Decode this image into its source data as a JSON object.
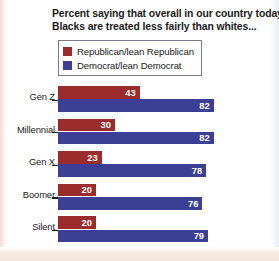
{
  "chart_data": {
    "type": "bar",
    "orientation": "horizontal",
    "title": "Percent saying that overall in our country today, Blacks are treated less fairly than whites...",
    "title_lines": [
      "Percent saying that overall in our country today,",
      "Blacks are treated less fairly than whites..."
    ],
    "xlabel": "",
    "ylabel": "",
    "xlim": [
      0,
      100
    ],
    "grid": false,
    "legend_position": "top-left",
    "categories": [
      "Gen Z",
      "Millennial",
      "Gen X",
      "Boomer",
      "Silent"
    ],
    "series": [
      {
        "name": "Republican/lean Republican",
        "color": "#9c2b2b",
        "values": [
          43,
          30,
          23,
          20,
          20
        ]
      },
      {
        "name": "Democrat/lean Democrat",
        "color": "#3c3f96",
        "values": [
          82,
          82,
          78,
          76,
          79
        ]
      }
    ]
  },
  "legend": {
    "items": [
      {
        "label": "Republican/lean Republican",
        "color": "#9c2b2b"
      },
      {
        "label": "Democrat/lean Democrat",
        "color": "#3c3f96"
      }
    ]
  },
  "rows": [
    {
      "category": "Gen Z",
      "rep": {
        "value": "43",
        "pct": 43
      },
      "dem": {
        "value": "82",
        "pct": 82
      }
    },
    {
      "category": "Millennial",
      "rep": {
        "value": "30",
        "pct": 30
      },
      "dem": {
        "value": "82",
        "pct": 82
      }
    },
    {
      "category": "Gen X",
      "rep": {
        "value": "23",
        "pct": 23
      },
      "dem": {
        "value": "78",
        "pct": 78
      }
    },
    {
      "category": "Boomer",
      "rep": {
        "value": "20",
        "pct": 20
      },
      "dem": {
        "value": "76",
        "pct": 76
      }
    },
    {
      "category": "Silent",
      "rep": {
        "value": "20",
        "pct": 20
      },
      "dem": {
        "value": "79",
        "pct": 79
      }
    }
  ],
  "scale": {
    "px_per_unit": 1.9,
    "origin_x": 58
  }
}
